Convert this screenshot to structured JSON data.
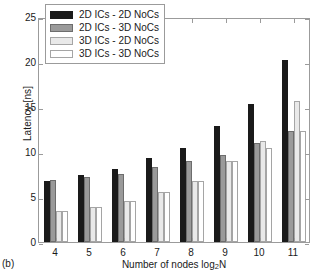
{
  "caption": "(b)",
  "chart_data": {
    "type": "bar",
    "title": "",
    "xlabel": "Number of nodes log2N",
    "xlabel_prefix": "Number of nodes log",
    "xlabel_sub": "2",
    "xlabel_suffix": "N",
    "ylabel": "Latency [ns]",
    "ylim": [
      0,
      25
    ],
    "yticks": [
      0,
      5,
      10,
      15,
      20,
      25
    ],
    "ytick_labels": [
      "0",
      "5",
      "10",
      "15",
      "20",
      "25"
    ],
    "categories": [
      "4",
      "5",
      "6",
      "7",
      "8",
      "9",
      "10",
      "11"
    ],
    "grid": false,
    "legend_position": "upper-left",
    "series": [
      {
        "name": "2D ICs - 2D NoCs",
        "color": "#1a1a1a",
        "edge": "#1a1a1a",
        "values": [
          6.8,
          7.5,
          8.1,
          9.3,
          10.5,
          12.9,
          15.3,
          20.2
        ]
      },
      {
        "name": "2D ICs - 3D NoCs",
        "color": "#9a9a9a",
        "edge": "#6d6d6d",
        "values": [
          6.9,
          7.2,
          7.6,
          8.3,
          9.0,
          9.7,
          11.0,
          12.3
        ]
      },
      {
        "name": "3D ICs - 2D NoCs",
        "color": "#e9e9e9",
        "edge": "#a5a5a5",
        "values": [
          3.4,
          3.9,
          4.6,
          5.6,
          6.8,
          9.0,
          11.2,
          15.7
        ]
      },
      {
        "name": "3D ICs - 3D NoCs",
        "color": "#ffffff",
        "edge": "#a5a5a5",
        "values": [
          3.4,
          3.9,
          4.6,
          5.6,
          6.8,
          9.0,
          10.4,
          12.3
        ]
      }
    ]
  }
}
